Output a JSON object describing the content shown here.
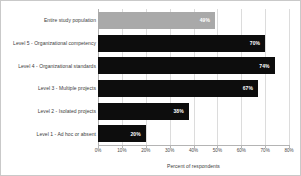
{
  "chart_data": {
    "type": "bar",
    "orientation": "horizontal",
    "title": "",
    "xlabel": "Percent of respondents",
    "ylabel": "",
    "xlim": [
      0,
      80
    ],
    "xticks": [
      0,
      10,
      20,
      30,
      40,
      50,
      60,
      70,
      80
    ],
    "xtick_labels": [
      "0%",
      "10%",
      "20%",
      "30%",
      "40%",
      "50%",
      "60%",
      "70%",
      "80%"
    ],
    "grid": true,
    "legend": "none",
    "categories": [
      "Entire study population",
      "Level 5 - Organizational competency",
      "Level 4 - Organizational standards",
      "Level 3 - Multiple projects",
      "Level 2 - Isolated projects",
      "Level 1 - Ad hoc or absent"
    ],
    "values": [
      49,
      70,
      74,
      67,
      38,
      20
    ],
    "value_labels": [
      "49%",
      "70%",
      "74%",
      "67%",
      "38%",
      "20%"
    ],
    "bar_colors": [
      "#a9a9a9",
      "#0d0d0d",
      "#0d0d0d",
      "#0d0d0d",
      "#0d0d0d",
      "#0d0d0d"
    ]
  },
  "bars": [
    {
      "label": "Entire study population",
      "value": 49,
      "value_label": "49%",
      "highlight": true
    },
    {
      "label": "Level 5 - Organizational competency",
      "value": 70,
      "value_label": "70%",
      "highlight": false
    },
    {
      "label": "Level 4 - Organizational standards",
      "value": 74,
      "value_label": "74%",
      "highlight": false
    },
    {
      "label": "Level 3 - Multiple projects",
      "value": 67,
      "value_label": "67%",
      "highlight": false
    },
    {
      "label": "Level 2 - Isolated projects",
      "value": 38,
      "value_label": "38%",
      "highlight": false
    },
    {
      "label": "Level 1 - Ad hoc or absent",
      "value": 20,
      "value_label": "20%",
      "highlight": false
    }
  ],
  "axis": {
    "title": "Percent of respondents",
    "ticks": [
      "0%",
      "10%",
      "20%",
      "30%",
      "40%",
      "50%",
      "60%",
      "70%",
      "80%"
    ]
  }
}
